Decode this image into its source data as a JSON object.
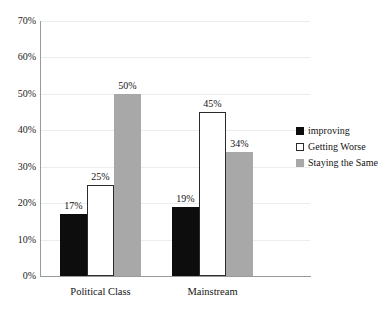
{
  "chart_data": {
    "type": "bar",
    "title": "",
    "xlabel": "",
    "ylabel": "",
    "categories": [
      "Political Class",
      "Mainstream"
    ],
    "series": [
      {
        "name": "improving",
        "values": [
          17,
          19
        ],
        "color": "#0d0d0d"
      },
      {
        "name": "Getting Worse",
        "values": [
          25,
          45
        ],
        "color": "#ffffff"
      },
      {
        "name": "Staying the Same",
        "values": [
          50,
          34
        ],
        "color": "#a8a8a8"
      }
    ],
    "value_labels": [
      [
        "17%",
        "25%",
        "50%"
      ],
      [
        "19%",
        "45%",
        "34%"
      ]
    ],
    "ylim": [
      0,
      70
    ],
    "ytick_labels": [
      "0%",
      "10%",
      "20%",
      "30%",
      "40%",
      "50%",
      "60%",
      "70%"
    ],
    "ytick_values": [
      0,
      10,
      20,
      30,
      40,
      50,
      60,
      70
    ],
    "grid": true,
    "legend_position": "right"
  },
  "legend": {
    "entries": [
      {
        "label": "improving"
      },
      {
        "label": "Getting Worse"
      },
      {
        "label": "Staying the Same"
      }
    ]
  }
}
